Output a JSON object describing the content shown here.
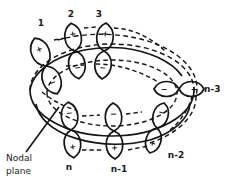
{
  "figure": {
    "type": "orbital-diagram",
    "title_visible": false,
    "background_color": "#ffffff",
    "stroke_color": "#151515",
    "annotations": {
      "nodal_plane_line1": "Nodal",
      "nodal_plane_line2": "plane"
    },
    "position_labels": [
      {
        "id": "pos-1",
        "text": "1",
        "x": 41,
        "y": 23
      },
      {
        "id": "pos-2",
        "text": "2",
        "x": 71,
        "y": 14
      },
      {
        "id": "pos-3",
        "text": "3",
        "x": 99,
        "y": 14
      },
      {
        "id": "pos-n3",
        "text": "n-3",
        "x": 214,
        "y": 89
      },
      {
        "id": "pos-n2",
        "text": "n-2",
        "x": 176,
        "y": 155
      },
      {
        "id": "pos-n1",
        "text": "n-1",
        "x": 119,
        "y": 168
      },
      {
        "id": "pos-n",
        "text": "n",
        "x": 69,
        "y": 168
      }
    ],
    "orbitals": [
      {
        "id": "orb-1",
        "label": "1",
        "cx": 46,
        "cy": 66,
        "rot": -22,
        "top_sign": "+",
        "bottom_sign": "−"
      },
      {
        "id": "orb-2",
        "label": "2",
        "cx": 75,
        "cy": 51,
        "rot": -8,
        "top_sign": "+",
        "bottom_sign": "−"
      },
      {
        "id": "orb-3",
        "label": "3",
        "cx": 104,
        "cy": 51,
        "rot": 4,
        "top_sign": "+",
        "bottom_sign": "−"
      },
      {
        "id": "orb-n3",
        "label": "n-3",
        "cx": 179,
        "cy": 89,
        "rot": 90,
        "top_sign": "+",
        "bottom_sign": "−"
      },
      {
        "id": "orb-n2",
        "label": "n-2",
        "cx": 157,
        "cy": 128,
        "rot": 16,
        "top_sign": "−",
        "bottom_sign": "+"
      },
      {
        "id": "orb-n1",
        "label": "n-1",
        "cx": 114,
        "cy": 131,
        "rot": -2,
        "top_sign": "−",
        "bottom_sign": "+"
      },
      {
        "id": "orb-n",
        "label": "n",
        "cx": 71,
        "cy": 130,
        "rot": -6,
        "top_sign": "−",
        "bottom_sign": "+"
      }
    ],
    "ring": {
      "cx": 112,
      "cy": 90,
      "rx": 82,
      "ry": 46,
      "style": "solid-front-dashed-back"
    },
    "sign_glyphs": {
      "plus": "+",
      "minus": "−"
    }
  }
}
